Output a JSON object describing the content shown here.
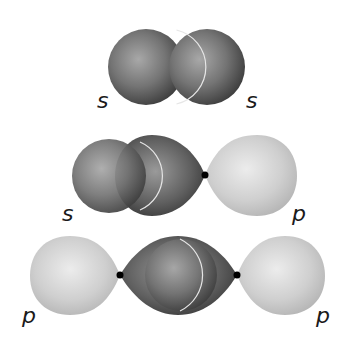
{
  "diagram": {
    "rows": [
      {
        "id": "s-s",
        "left_label": "s",
        "right_label": "s"
      },
      {
        "id": "s-p",
        "left_label": "s",
        "right_label": "p"
      },
      {
        "id": "p-p",
        "left_label": "p",
        "right_label": "p"
      }
    ],
    "colors": {
      "s_orbital": "#6e6e6e",
      "p_orbital_light": "#c8c8c8",
      "p_orbital_dark": "#5a5a5a",
      "nucleus": "#000000",
      "overlap_edge": "#e8e8e8"
    }
  }
}
